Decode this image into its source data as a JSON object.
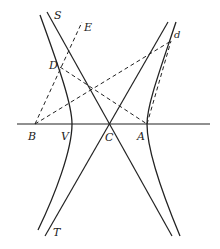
{
  "figure": {
    "colors": {
      "ink": "#222222",
      "background": "#ffffff"
    }
  },
  "points": {
    "B": {
      "label": "B",
      "x": 35,
      "y": 124
    },
    "V": {
      "label": "V",
      "x": 72,
      "y": 124
    },
    "C": {
      "label": "C",
      "x": 110,
      "y": 124
    },
    "A": {
      "label": "A",
      "x": 147,
      "y": 124
    },
    "D": {
      "label": "D",
      "x": 60,
      "y": 67
    },
    "E": {
      "label": "E",
      "x": 82,
      "y": 22
    },
    "d": {
      "label": "d",
      "x": 171,
      "y": 41
    },
    "S": {
      "label": "S"
    },
    "T": {
      "label": "T"
    }
  },
  "lines": {
    "axis": {
      "style": "solid",
      "from": [
        17,
        124
      ],
      "to": [
        210,
        124
      ]
    },
    "asymptote_S": {
      "style": "solid",
      "from": [
        47,
        12
      ],
      "to": [
        172,
        236
      ]
    },
    "asymptote_T": {
      "style": "solid",
      "from": [
        168,
        22
      ],
      "to": [
        45,
        236
      ]
    },
    "BE": {
      "style": "dashed",
      "from": [
        35,
        124
      ],
      "to": [
        82,
        22
      ]
    },
    "DA": {
      "style": "dashed",
      "from": [
        60,
        67
      ],
      "to": [
        147,
        124
      ]
    },
    "Bd": {
      "style": "dashed",
      "from": [
        35,
        124
      ],
      "to": [
        171,
        41
      ]
    },
    "Ad": {
      "style": "dashed",
      "from": [
        147,
        124
      ],
      "to": [
        171,
        41
      ]
    }
  },
  "curves": {
    "left_branch": "M40,15 Q78,120 72,124 Q70,140 38,230",
    "right_branch": "M176,22 Q145,118 147,124 Q150,150 180,236"
  }
}
